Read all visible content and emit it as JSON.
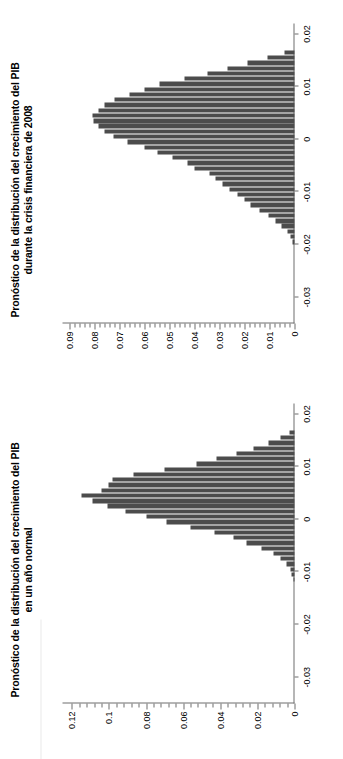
{
  "figure": {
    "background": "#ffffff",
    "bar_color": "#4c4c4c",
    "axis_color": "#6f6f6f",
    "orientation_note": "figure rendered sideways (rotated 90 degrees counter-clockwise) within a portrait page"
  },
  "chart_data": [
    {
      "id": "normal-year",
      "type": "bar",
      "title": "Pronóstico de la distribución del crecimiento del PIB en un año normal",
      "title_line1": "Pronóstico de la distribución del crecimiento del PIB",
      "title_line2": "en un año normal",
      "xlabel": "",
      "ylabel": "",
      "xlim": [
        -0.035,
        0.022
      ],
      "ylim": [
        0,
        0.125
      ],
      "xticks": [
        -0.03,
        -0.02,
        -0.01,
        0,
        0.01,
        0.02
      ],
      "xtick_labels": [
        "-0.03",
        "-0.02",
        "-0.01",
        "0",
        "0.01",
        "0.02"
      ],
      "yticks": [
        0,
        0.02,
        0.04,
        0.06,
        0.08,
        0.1,
        0.12
      ],
      "ytick_labels": [
        "0",
        "0.02",
        "0.04",
        "0.06",
        "0.08",
        "0.1",
        "0.12"
      ],
      "grid": false,
      "legend": "none",
      "bin_width": 0.001,
      "x": [
        -0.0115,
        -0.0105,
        -0.0095,
        -0.0085,
        -0.0075,
        -0.0065,
        -0.0055,
        -0.0045,
        -0.0035,
        -0.0025,
        -0.0015,
        -0.0005,
        0.0005,
        0.0015,
        0.0025,
        0.0035,
        0.0045,
        0.0055,
        0.0065,
        0.0075,
        0.0085,
        0.0095,
        0.0105,
        0.0115,
        0.0125,
        0.0135,
        0.0145,
        0.0155,
        0.0165
      ],
      "values": [
        0.0008,
        0.0014,
        0.0022,
        0.0045,
        0.0075,
        0.0115,
        0.018,
        0.026,
        0.033,
        0.043,
        0.056,
        0.069,
        0.08,
        0.091,
        0.101,
        0.109,
        0.115,
        0.104,
        0.1,
        0.098,
        0.087,
        0.07,
        0.053,
        0.042,
        0.031,
        0.022,
        0.014,
        0.0075,
        0.0025
      ]
    },
    {
      "id": "crisis-2008",
      "type": "bar",
      "title": "Pronóstico de la distribución del crecimiento del PIB durante la crisis financiera de 2008",
      "title_line1": "Pronóstico de la distribución del crecimiento del PIB",
      "title_line2": "durante  la crisis financiera de 2008",
      "xlabel": "",
      "ylabel": "",
      "xlim": [
        -0.035,
        0.022
      ],
      "ylim": [
        0,
        0.093
      ],
      "xticks": [
        -0.03,
        -0.02,
        -0.01,
        0,
        0.01,
        0.02
      ],
      "xtick_labels": [
        "-0.03",
        "-0.02",
        "-0.01",
        "0",
        "0.01",
        "0.02"
      ],
      "yticks": [
        0,
        0.01,
        0.02,
        0.03,
        0.04,
        0.05,
        0.06,
        0.07,
        0.08,
        0.09
      ],
      "ytick_labels": [
        "0",
        "0.01",
        "0.02",
        "0.03",
        "0.04",
        "0.05",
        "0.06",
        "0.07",
        "0.08",
        "0.09"
      ],
      "grid": false,
      "legend": "none",
      "bin_width": 0.001,
      "x": [
        -0.0195,
        -0.0185,
        -0.0175,
        -0.0165,
        -0.0155,
        -0.0145,
        -0.0135,
        -0.0125,
        -0.0115,
        -0.0105,
        -0.0095,
        -0.0085,
        -0.0075,
        -0.0065,
        -0.0055,
        -0.0045,
        -0.0035,
        -0.0025,
        -0.0015,
        -0.0005,
        0.0005,
        0.0015,
        0.0025,
        0.0035,
        0.0045,
        0.0055,
        0.0065,
        0.0075,
        0.0085,
        0.0095,
        0.0105,
        0.0115,
        0.0125,
        0.0135,
        0.0145,
        0.0155,
        0.0165
      ],
      "values": [
        0.001,
        0.0018,
        0.0028,
        0.0052,
        0.0075,
        0.0105,
        0.014,
        0.0175,
        0.02,
        0.023,
        0.026,
        0.029,
        0.0315,
        0.034,
        0.04,
        0.043,
        0.049,
        0.055,
        0.06,
        0.067,
        0.0725,
        0.076,
        0.0785,
        0.0805,
        0.081,
        0.0785,
        0.076,
        0.072,
        0.066,
        0.06,
        0.054,
        0.044,
        0.035,
        0.027,
        0.019,
        0.011,
        0.004
      ]
    }
  ]
}
